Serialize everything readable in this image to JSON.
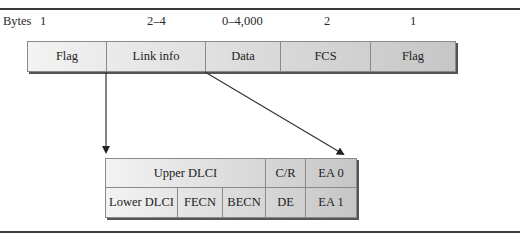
{
  "figure": {
    "bytes_label": "Bytes",
    "frame": {
      "byte_sizes": [
        "1",
        "2–4",
        "0–4,000",
        "2",
        "1"
      ],
      "fields": [
        "Flag",
        "Link info",
        "Data",
        "FCS",
        "Flag"
      ]
    },
    "link_info_detail": {
      "row1": [
        "Upper DLCI",
        "C/R",
        "EA 0"
      ],
      "row2": [
        "Lower DLCI",
        "FECN",
        "BECN",
        "DE",
        "EA 1"
      ]
    },
    "colors": {
      "gradient_start": "#f3f3f3",
      "gradient_end": "#c6c6c6",
      "border": "#8a8a8a",
      "line": "#333333"
    }
  }
}
